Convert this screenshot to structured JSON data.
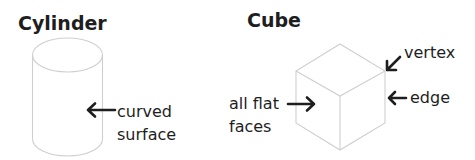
{
  "cylinder": {
    "title": "Cylinder",
    "labels": {
      "curved_surface_line1": "curved",
      "curved_surface_line2": "surface"
    }
  },
  "cube": {
    "title": "Cube",
    "labels": {
      "vertex": "vertex",
      "edge": "edge",
      "faces_line1": "all flat",
      "faces_line2": "faces"
    }
  },
  "colors": {
    "text": "#1e1e1e",
    "shape_outline": "#cfcfcf",
    "background": "#ffffff"
  }
}
